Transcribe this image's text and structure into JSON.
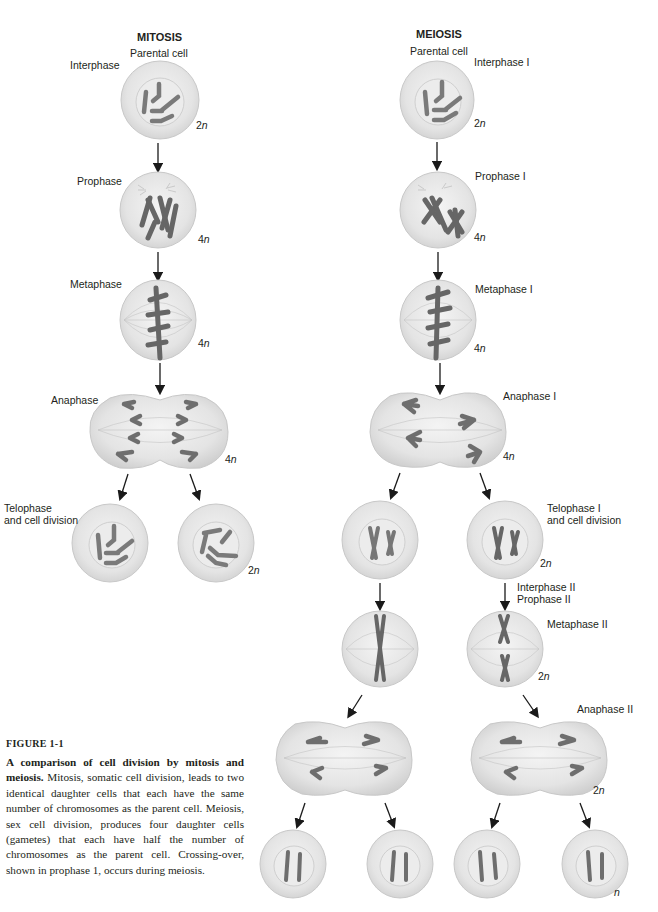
{
  "figure": {
    "columns": {
      "mitosis": {
        "title": "MITOSIS",
        "parental_label": "Parental cell"
      },
      "meiosis": {
        "title": "MEIOSIS",
        "parental_label": "Parental cell"
      }
    },
    "mitosis_stages": {
      "interphase": "Interphase",
      "prophase": "Prophase",
      "metaphase": "Metaphase",
      "anaphase": "Anaphase",
      "telophase_line1": "Telophase",
      "telophase_line2": "and cell division"
    },
    "meiosis_stages": {
      "interphase1": "Interphase I",
      "prophase1": "Prophase I",
      "metaphase1": "Metaphase I",
      "anaphase1": "Anaphase I",
      "telophase1_line1": "Telophase I",
      "telophase1_line2": "and cell division",
      "interphase2": "Interphase II",
      "prophase2": "Prophase II",
      "metaphase2": "Metaphase II",
      "anaphase2": "Anaphase II"
    },
    "ploidy": {
      "mitosis_interphase": "2",
      "mitosis_prophase": "4",
      "mitosis_metaphase": "4",
      "mitosis_anaphase": "4",
      "mitosis_daughters": "2",
      "meiosis_interphase1": "2",
      "meiosis_prophase1": "4",
      "meiosis_metaphase1": "4",
      "meiosis_anaphase1": "4",
      "meiosis_telophase1": "2",
      "meiosis_metaphase2": "2",
      "meiosis_anaphase2": "2",
      "meiosis_gametes": "",
      "n_symbol": "n"
    },
    "colors": {
      "cell_fill": "#e6e6e6",
      "cell_edge": "#c8c8c8",
      "nucleus_fill": "#ececec",
      "chromosome": "#7a7a7a",
      "centromere": "#111111",
      "arrow": "#1a1a1a"
    }
  },
  "caption": {
    "figure_label": "FIGURE 1-1",
    "title": "A comparison of cell division by mitosis and meiosis.",
    "body": "Mitosis, somatic cell division, leads to two identical daughter cells that each have the same number of chromosomes as the parent cell. Meiosis, sex cell division, produces four daughter cells (gametes) that each have half the number of chromosomes as the parent cell. Crossing-over, shown in prophase 1, occurs during meiosis."
  }
}
